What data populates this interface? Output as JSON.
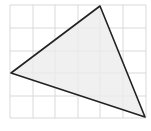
{
  "diagram": {
    "type": "triangle-on-grid",
    "grid": {
      "columns": 6,
      "rows": 5,
      "x_lines": [
        10,
        33,
        55,
        78,
        100,
        123,
        146
      ],
      "y_lines": [
        5,
        28,
        51,
        73,
        96,
        118
      ],
      "line_color": "#d9d9d9"
    },
    "triangle": {
      "vertices": [
        [
          100,
          6
        ],
        [
          11,
          73
        ],
        [
          145,
          117
        ]
      ],
      "grid_vertices": [
        [
          4,
          0
        ],
        [
          0,
          3
        ],
        [
          6,
          5
        ]
      ],
      "fill": "#ececec",
      "stroke": "#222222"
    }
  }
}
